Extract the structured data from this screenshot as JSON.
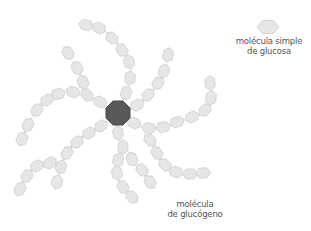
{
  "legend": {
    "simple_label_line1": "molécula simple",
    "simple_label_line2": "de glucosa"
  },
  "glycogen_label": {
    "line1": "molécula",
    "line2": "de glucógeno"
  },
  "colors": {
    "glucose_fill": "#e6e6e6",
    "glucose_stroke": "#cdcdcd",
    "core_fill": "#595959",
    "text": "#555555"
  },
  "core": {
    "cx": 118,
    "cy": 113,
    "r": 13
  },
  "chains": [
    {
      "name": "upper-arc",
      "units": [
        [
          126,
          93
        ],
        [
          130,
          78
        ],
        [
          129,
          62
        ],
        [
          122,
          50
        ],
        [
          112,
          38
        ],
        [
          99,
          28
        ],
        [
          86,
          25
        ]
      ]
    },
    {
      "name": "upper-left",
      "units": [
        [
          100,
          102
        ],
        [
          87,
          95
        ],
        [
          83,
          82
        ],
        [
          77,
          68
        ],
        [
          68,
          53
        ]
      ]
    },
    {
      "name": "left-branch",
      "units": [
        [
          73,
          92
        ],
        [
          58,
          94
        ],
        [
          47,
          100
        ],
        [
          37,
          110
        ],
        [
          28,
          125
        ],
        [
          22,
          139
        ]
      ]
    },
    {
      "name": "upper-right",
      "units": [
        [
          137,
          105
        ],
        [
          148,
          95
        ],
        [
          158,
          83
        ],
        [
          164,
          71
        ],
        [
          168,
          55
        ]
      ]
    },
    {
      "name": "right-arc",
      "units": [
        [
          134,
          123
        ],
        [
          149,
          128
        ],
        [
          163,
          127
        ],
        [
          177,
          122
        ],
        [
          192,
          117
        ],
        [
          205,
          110
        ],
        [
          211,
          98
        ],
        [
          210,
          83
        ]
      ]
    },
    {
      "name": "lower-right",
      "units": [
        [
          150,
          140
        ],
        [
          157,
          153
        ],
        [
          165,
          165
        ],
        [
          176,
          172
        ],
        [
          190,
          174
        ],
        [
          203,
          173
        ]
      ]
    },
    {
      "name": "down",
      "units": [
        [
          118,
          133
        ],
        [
          123,
          147
        ],
        [
          118,
          160
        ],
        [
          117,
          173
        ],
        [
          123,
          187
        ],
        [
          132,
          197
        ]
      ]
    },
    {
      "name": "down-branch",
      "units": [
        [
          132,
          159
        ],
        [
          142,
          170
        ],
        [
          150,
          182
        ]
      ]
    },
    {
      "name": "lower-left",
      "units": [
        [
          101,
          126
        ],
        [
          89,
          133
        ],
        [
          77,
          142
        ],
        [
          67,
          153
        ],
        [
          61,
          167
        ],
        [
          57,
          182
        ]
      ]
    },
    {
      "name": "lower-left-branch",
      "units": [
        [
          50,
          163
        ],
        [
          37,
          166
        ],
        [
          27,
          176
        ],
        [
          20,
          189
        ]
      ]
    }
  ],
  "legend_unit": {
    "cx": 268,
    "cy": 27
  }
}
